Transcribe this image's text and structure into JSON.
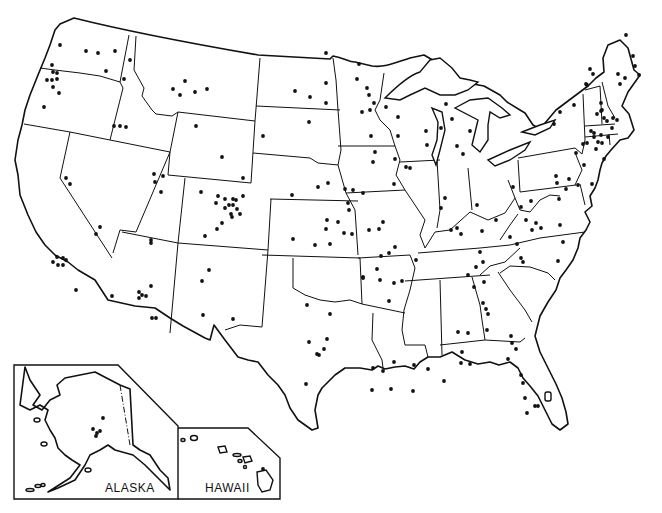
{
  "map": {
    "title": "United States",
    "insets": [
      {
        "name": "alaska",
        "label": "ALASKA"
      },
      {
        "name": "hawaii",
        "label": "HAWAII"
      }
    ],
    "colors": {
      "ink": "#111111",
      "background": "#ffffff"
    },
    "dot_radius": 1.9,
    "dots": [
      [
        60,
        45
      ],
      [
        86,
        51
      ],
      [
        98,
        53
      ],
      [
        115,
        51
      ],
      [
        106,
        71
      ],
      [
        130,
        60
      ],
      [
        124,
        79
      ],
      [
        52,
        65
      ],
      [
        53,
        72
      ],
      [
        57,
        73
      ],
      [
        47,
        80
      ],
      [
        52,
        80
      ],
      [
        57,
        79
      ],
      [
        53,
        87
      ],
      [
        59,
        93
      ],
      [
        44,
        107
      ],
      [
        114,
        126
      ],
      [
        120,
        126
      ],
      [
        126,
        127
      ],
      [
        173,
        89
      ],
      [
        185,
        81
      ],
      [
        180,
        95
      ],
      [
        195,
        92
      ],
      [
        207,
        89
      ],
      [
        196,
        126
      ],
      [
        222,
        157
      ],
      [
        243,
        178
      ],
      [
        295,
        91
      ],
      [
        310,
        97
      ],
      [
        326,
        83
      ],
      [
        326,
        103
      ],
      [
        326,
        53
      ],
      [
        263,
        136
      ],
      [
        309,
        122
      ],
      [
        66,
        178
      ],
      [
        70,
        184
      ],
      [
        100,
        227
      ],
      [
        96,
        234
      ],
      [
        154,
        174
      ],
      [
        155,
        182
      ],
      [
        163,
        176
      ],
      [
        161,
        192
      ],
      [
        151,
        240
      ],
      [
        201,
        192
      ],
      [
        218,
        196
      ],
      [
        225,
        199
      ],
      [
        233,
        199
      ],
      [
        229,
        205
      ],
      [
        236,
        200
      ],
      [
        243,
        196
      ],
      [
        216,
        203
      ],
      [
        225,
        208
      ],
      [
        233,
        205
      ],
      [
        237,
        209
      ],
      [
        231,
        214
      ],
      [
        240,
        214
      ],
      [
        232,
        217
      ],
      [
        222,
        223
      ],
      [
        205,
        236
      ],
      [
        217,
        229
      ],
      [
        57,
        257
      ],
      [
        63,
        258
      ],
      [
        66,
        260
      ],
      [
        53,
        262
      ],
      [
        58,
        265
      ],
      [
        63,
        265
      ],
      [
        76,
        290
      ],
      [
        151,
        243
      ],
      [
        151,
        286
      ],
      [
        139,
        292
      ],
      [
        142,
        295
      ],
      [
        146,
        296
      ],
      [
        139,
        298
      ],
      [
        152,
        318
      ],
      [
        156,
        318
      ],
      [
        112,
        296
      ],
      [
        209,
        270
      ],
      [
        202,
        281
      ],
      [
        203,
        315
      ],
      [
        233,
        319
      ],
      [
        292,
        195
      ],
      [
        318,
        187
      ],
      [
        328,
        183
      ],
      [
        327,
        220
      ],
      [
        330,
        244
      ],
      [
        315,
        245
      ],
      [
        353,
        190
      ],
      [
        363,
        193
      ],
      [
        345,
        189
      ],
      [
        348,
        203
      ],
      [
        349,
        210
      ],
      [
        383,
        222
      ],
      [
        293,
        239
      ],
      [
        326,
        229
      ],
      [
        338,
        222
      ],
      [
        344,
        233
      ],
      [
        352,
        234
      ],
      [
        369,
        230
      ],
      [
        379,
        229
      ],
      [
        395,
        247
      ],
      [
        389,
        253
      ],
      [
        381,
        256
      ],
      [
        377,
        269
      ],
      [
        363,
        277
      ],
      [
        363,
        278
      ],
      [
        416,
        260
      ],
      [
        402,
        281
      ],
      [
        389,
        301
      ],
      [
        394,
        283
      ],
      [
        307,
        305
      ],
      [
        330,
        314
      ],
      [
        327,
        339
      ],
      [
        324,
        349
      ],
      [
        317,
        354
      ],
      [
        319,
        355
      ],
      [
        309,
        342
      ],
      [
        306,
        384
      ],
      [
        373,
        368
      ],
      [
        383,
        371
      ],
      [
        394,
        362
      ],
      [
        372,
        390
      ],
      [
        391,
        389
      ],
      [
        380,
        280
      ],
      [
        414,
        365
      ],
      [
        428,
        369
      ],
      [
        413,
        391
      ],
      [
        444,
        381
      ],
      [
        458,
        332
      ],
      [
        468,
        333
      ],
      [
        462,
        352
      ],
      [
        470,
        364
      ],
      [
        461,
        363
      ],
      [
        474,
        287
      ],
      [
        484,
        282
      ],
      [
        483,
        303
      ],
      [
        486,
        309
      ],
      [
        488,
        314
      ],
      [
        487,
        330
      ],
      [
        511,
        336
      ],
      [
        516,
        349
      ],
      [
        508,
        359
      ],
      [
        521,
        375
      ],
      [
        512,
        343
      ],
      [
        523,
        383
      ],
      [
        525,
        398
      ],
      [
        535,
        406
      ],
      [
        527,
        413
      ],
      [
        538,
        406
      ],
      [
        359,
        64
      ],
      [
        386,
        107
      ],
      [
        357,
        79
      ],
      [
        367,
        88
      ],
      [
        369,
        95
      ],
      [
        374,
        103
      ],
      [
        362,
        112
      ],
      [
        370,
        110
      ],
      [
        398,
        117
      ],
      [
        398,
        136
      ],
      [
        427,
        145
      ],
      [
        426,
        131
      ],
      [
        446,
        104
      ],
      [
        441,
        128
      ],
      [
        452,
        119
      ],
      [
        457,
        146
      ],
      [
        470,
        131
      ],
      [
        463,
        154
      ],
      [
        371,
        136
      ],
      [
        375,
        152
      ],
      [
        373,
        162
      ],
      [
        394,
        184
      ],
      [
        395,
        159
      ],
      [
        406,
        167
      ],
      [
        410,
        168
      ],
      [
        441,
        208
      ],
      [
        445,
        198
      ],
      [
        457,
        228
      ],
      [
        461,
        234
      ],
      [
        496,
        220
      ],
      [
        477,
        205
      ],
      [
        451,
        230
      ],
      [
        482,
        231
      ],
      [
        480,
        252
      ],
      [
        483,
        262
      ],
      [
        476,
        267
      ],
      [
        468,
        275
      ],
      [
        510,
        237
      ],
      [
        517,
        244
      ],
      [
        521,
        258
      ],
      [
        523,
        262
      ],
      [
        513,
        187
      ],
      [
        526,
        220
      ],
      [
        541,
        228
      ],
      [
        556,
        176
      ],
      [
        559,
        199
      ],
      [
        557,
        183
      ],
      [
        560,
        225
      ],
      [
        558,
        261
      ],
      [
        563,
        242
      ],
      [
        521,
        207
      ],
      [
        531,
        201
      ],
      [
        536,
        223
      ],
      [
        532,
        230
      ],
      [
        590,
        69
      ],
      [
        586,
        84
      ],
      [
        593,
        74
      ],
      [
        618,
        74
      ],
      [
        620,
        84
      ],
      [
        625,
        78
      ],
      [
        601,
        103
      ],
      [
        602,
        110
      ],
      [
        601,
        111
      ],
      [
        604,
        118
      ],
      [
        607,
        121
      ],
      [
        613,
        118
      ],
      [
        617,
        120
      ],
      [
        597,
        114
      ],
      [
        591,
        131
      ],
      [
        594,
        133
      ],
      [
        601,
        135
      ],
      [
        608,
        137
      ],
      [
        612,
        128
      ],
      [
        554,
        124
      ],
      [
        560,
        112
      ],
      [
        574,
        105
      ],
      [
        587,
        85
      ],
      [
        604,
        159
      ],
      [
        578,
        185
      ],
      [
        592,
        184
      ],
      [
        584,
        165
      ],
      [
        569,
        179
      ],
      [
        566,
        189
      ],
      [
        576,
        153
      ],
      [
        583,
        144
      ],
      [
        587,
        143
      ],
      [
        594,
        137
      ],
      [
        598,
        142
      ],
      [
        602,
        143
      ],
      [
        596,
        149
      ],
      [
        626,
        35
      ],
      [
        633,
        56
      ],
      [
        635,
        66
      ],
      [
        639,
        75
      ],
      [
        103,
        418
      ],
      [
        97,
        433
      ],
      [
        100,
        431
      ],
      [
        93,
        429
      ],
      [
        96,
        436
      ],
      [
        263,
        469
      ]
    ]
  }
}
